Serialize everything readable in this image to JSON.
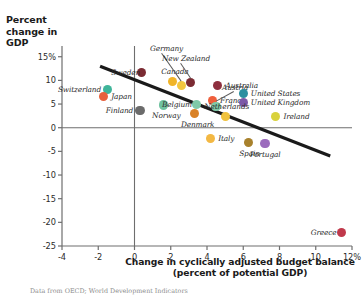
{
  "chart_data": {
    "type": "scatter",
    "title": "",
    "xlabel": "Change in cyclically adjusted budget balance (percent of potential GDP)",
    "ylabel": "Percent change in GDP",
    "xlim": [
      -4,
      12
    ],
    "ylim": [
      -25,
      16
    ],
    "grid": false,
    "legend": "none",
    "xticks": [
      "-4",
      "-2",
      "0",
      "2",
      "4",
      "6",
      "8",
      "10",
      "12%"
    ],
    "xtick_values": [
      -4,
      -2,
      0,
      2,
      4,
      6,
      8,
      10,
      12
    ],
    "yticks": [
      "15%",
      "10",
      "5",
      "0",
      "-5",
      "-10",
      "-15",
      "-20",
      "-25"
    ],
    "ytick_values": [
      15,
      10,
      5,
      0,
      -5,
      -10,
      -15,
      -20,
      -25
    ],
    "points": [
      {
        "name": "Switzerland",
        "x": -1.5,
        "y": 8.0,
        "color": "#3fb59a",
        "label_side": "left"
      },
      {
        "name": "Japan",
        "x": -1.7,
        "y": 6.6,
        "color": "#e8613c",
        "label_side": "right"
      },
      {
        "name": "Sweden",
        "x": 0.4,
        "y": 11.7,
        "color": "#7b2b33",
        "label_side": "left"
      },
      {
        "name": "Finland",
        "x": 0.3,
        "y": 3.7,
        "color": "#6b6b6b",
        "label_side": "left"
      },
      {
        "name": "Norway",
        "x": 1.6,
        "y": 4.8,
        "color": "#6fc2a0",
        "label_side": "below"
      },
      {
        "name": "Canada",
        "x": 2.1,
        "y": 9.7,
        "color": "#f0b429",
        "label_side": "above"
      },
      {
        "name": "Germany",
        "x": 2.6,
        "y": 8.9,
        "color": "#f3c63f",
        "label_side": "leader"
      },
      {
        "name": "New Zealand",
        "x": 3.1,
        "y": 9.6,
        "color": "#7b2b33",
        "label_side": "leader"
      },
      {
        "name": "Belgium",
        "x": 3.4,
        "y": 4.9,
        "color": "#7fc9a8",
        "label_side": "left"
      },
      {
        "name": "Denmark",
        "x": 3.3,
        "y": 3.0,
        "color": "#d98227",
        "label_side": "below"
      },
      {
        "name": "Australia",
        "x": 4.6,
        "y": 9.0,
        "color": "#8e2f3e",
        "label_side": "right"
      },
      {
        "name": "France",
        "x": 4.3,
        "y": 5.8,
        "color": "#ef5f3c",
        "label_side": "right"
      },
      {
        "name": "Austria",
        "x": 4.5,
        "y": 4.5,
        "color": "#7fc9a8",
        "label_side": "leader"
      },
      {
        "name": "United States",
        "x": 6.0,
        "y": 7.2,
        "color": "#2a8fa0",
        "label_side": "right"
      },
      {
        "name": "United Kingdom",
        "x": 6.0,
        "y": 5.4,
        "color": "#7b59a8",
        "label_side": "right"
      },
      {
        "name": "Netherlands",
        "x": 5.0,
        "y": 2.3,
        "color": "#f0c23d",
        "label_side": "above"
      },
      {
        "name": "Ireland",
        "x": 7.8,
        "y": 2.4,
        "color": "#d9d23c",
        "label_side": "right"
      },
      {
        "name": "Italy",
        "x": 4.2,
        "y": -2.3,
        "color": "#f3b843",
        "label_side": "right"
      },
      {
        "name": "Spain",
        "x": 6.3,
        "y": -3.2,
        "color": "#a8812c",
        "label_side": "below"
      },
      {
        "name": "Portugal",
        "x": 7.2,
        "y": -3.4,
        "color": "#9b6bbd",
        "label_side": "below"
      },
      {
        "name": "Greece",
        "x": 11.4,
        "y": -22.2,
        "color": "#c0394b",
        "label_side": "left"
      }
    ],
    "trendline": {
      "x0": -1.9,
      "y0": 13.0,
      "x1": 10.8,
      "y1": -6.0,
      "color": "#1a1a1a"
    },
    "axis_color": "#6e6e6e",
    "source_note": "Data from OECD; World Development Indicators"
  }
}
